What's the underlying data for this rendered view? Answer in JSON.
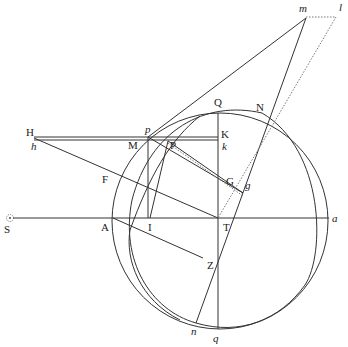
{
  "diagram": {
    "type": "geometric-construction",
    "points": {
      "S": {
        "label": "S",
        "x": 10,
        "y": 218
      },
      "H": {
        "label": "H",
        "x": 28,
        "y": 140
      },
      "h": {
        "label": "h",
        "x": 28,
        "y": 145
      },
      "p": {
        "label": "p",
        "x": 148,
        "y": 137
      },
      "M": {
        "label": "M",
        "x": 148,
        "y": 141
      },
      "P": {
        "label": "P",
        "x": 168,
        "y": 141
      },
      "K": {
        "label": "K",
        "x": 218,
        "y": 137
      },
      "k": {
        "label": "k",
        "x": 218,
        "y": 141
      },
      "Q": {
        "label": "Q",
        "x": 218,
        "y": 108
      },
      "N": {
        "label": "N",
        "x": 262,
        "y": 113
      },
      "m": {
        "label": "m",
        "x": 306,
        "y": 16
      },
      "l": {
        "label": "l",
        "x": 336,
        "y": 16
      },
      "F": {
        "label": "F",
        "x": 114,
        "y": 178
      },
      "G": {
        "label": "G",
        "x": 218,
        "y": 190
      },
      "g": {
        "label": "g",
        "x": 243,
        "y": 196
      },
      "A": {
        "label": "A",
        "x": 113,
        "y": 218
      },
      "I": {
        "label": "I",
        "x": 148,
        "y": 218
      },
      "T": {
        "label": "T",
        "x": 218,
        "y": 218
      },
      "a": {
        "label": "a",
        "x": 329,
        "y": 218
      },
      "Z": {
        "label": "Z",
        "x": 203,
        "y": 262
      },
      "n": {
        "label": "n",
        "x": 196,
        "y": 323
      },
      "q": {
        "label": "q",
        "x": 218,
        "y": 329
      }
    },
    "labels": [
      {
        "key": "S",
        "text": "S",
        "x": 4,
        "y": 224,
        "italic": false
      },
      {
        "key": "H",
        "text": "H",
        "x": 26,
        "y": 127,
        "italic": false
      },
      {
        "key": "h",
        "text": "h",
        "x": 31,
        "y": 141,
        "italic": true
      },
      {
        "key": "p",
        "text": "p",
        "x": 145,
        "y": 125,
        "italic": true
      },
      {
        "key": "M",
        "text": "M",
        "x": 128,
        "y": 140,
        "italic": false
      },
      {
        "key": "P",
        "text": "P",
        "x": 169,
        "y": 140,
        "italic": false
      },
      {
        "key": "K",
        "text": "K",
        "x": 221,
        "y": 130,
        "italic": false
      },
      {
        "key": "k",
        "text": "k",
        "x": 222,
        "y": 141,
        "italic": true
      },
      {
        "key": "Q",
        "text": "Q",
        "x": 214,
        "y": 97,
        "italic": false
      },
      {
        "key": "N",
        "text": "N",
        "x": 256,
        "y": 102,
        "italic": false
      },
      {
        "key": "m",
        "text": "m",
        "x": 300,
        "y": 4,
        "italic": true
      },
      {
        "key": "l",
        "text": "l",
        "x": 339,
        "y": 3,
        "italic": true
      },
      {
        "key": "F",
        "text": "F",
        "x": 102,
        "y": 175,
        "italic": false
      },
      {
        "key": "G",
        "text": "G",
        "x": 226,
        "y": 177,
        "italic": false
      },
      {
        "key": "g",
        "text": "g",
        "x": 244,
        "y": 180,
        "italic": true
      },
      {
        "key": "A",
        "text": "A",
        "x": 101,
        "y": 222,
        "italic": false
      },
      {
        "key": "I",
        "text": "I",
        "x": 148,
        "y": 222,
        "italic": false
      },
      {
        "key": "T",
        "text": "T",
        "x": 223,
        "y": 222,
        "italic": false
      },
      {
        "key": "a",
        "text": "a",
        "x": 332,
        "y": 214,
        "italic": true
      },
      {
        "key": "Z",
        "text": "Z",
        "x": 206,
        "y": 260,
        "italic": false
      },
      {
        "key": "n",
        "text": "n",
        "x": 191,
        "y": 327,
        "italic": true
      },
      {
        "key": "q",
        "text": "q",
        "x": 213,
        "y": 333,
        "italic": true
      }
    ],
    "stroke_color": "#333333",
    "dotted_color": "#777777"
  }
}
